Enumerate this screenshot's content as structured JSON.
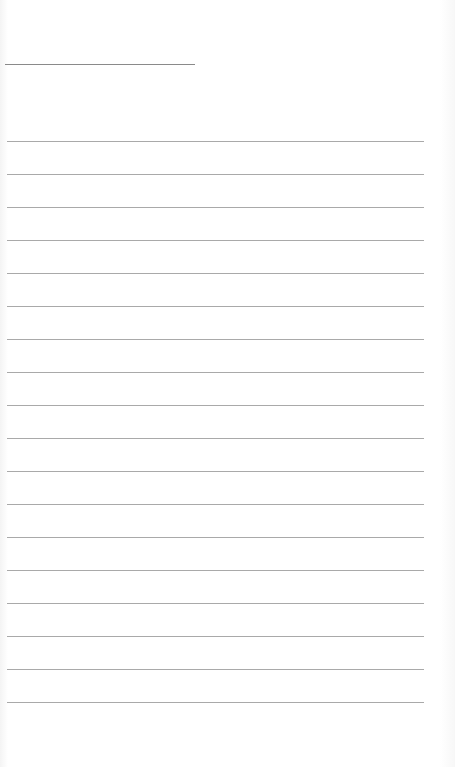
{
  "page": {
    "type": "blank-lined-sheet",
    "header_line": {
      "x": 5,
      "y": 64,
      "width": 190,
      "color": "#8a8a8a"
    },
    "rules": {
      "count": 18,
      "x": 7,
      "width": 417,
      "color": "#a9a9a9",
      "y_positions": [
        141,
        174,
        207,
        240,
        273,
        306,
        339,
        372,
        405,
        438,
        471,
        504,
        537,
        570,
        603,
        636,
        669,
        702
      ]
    }
  }
}
